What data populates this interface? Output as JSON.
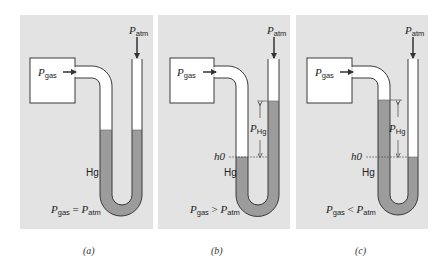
{
  "figure": {
    "panels": [
      {
        "id": "a",
        "caption": "(a)",
        "gas_label": {
          "symbol": "P",
          "sub": "gas"
        },
        "atm_label": {
          "symbol": "P",
          "sub": "atm"
        },
        "fluid_label": "Hg",
        "relation": {
          "left_sub": "gas",
          "op": "=",
          "right_sub": "atm"
        }
      },
      {
        "id": "b",
        "caption": "(b)",
        "gas_label": {
          "symbol": "P",
          "sub": "gas"
        },
        "atm_label": {
          "symbol": "P",
          "sub": "atm"
        },
        "fluid_label": "Hg",
        "height_label": {
          "symbol": "P",
          "sub": "Hg"
        },
        "reference_label": "h0",
        "relation": {
          "left_sub": "gas",
          "op": ">",
          "right_sub": "atm"
        }
      },
      {
        "id": "c",
        "caption": "(c)",
        "gas_label": {
          "symbol": "P",
          "sub": "gas"
        },
        "atm_label": {
          "symbol": "P",
          "sub": "atm"
        },
        "fluid_label": "Hg",
        "height_label": {
          "symbol": "P",
          "sub": "Hg"
        },
        "reference_label": "h0",
        "relation": {
          "left_sub": "gas",
          "op": "<",
          "right_sub": "atm"
        }
      }
    ],
    "colors": {
      "panel_bg": "#e3e3e3",
      "mercury": "#9c9c9c",
      "outline": "#3a3a3a",
      "tube_empty": "#ffffff"
    }
  }
}
